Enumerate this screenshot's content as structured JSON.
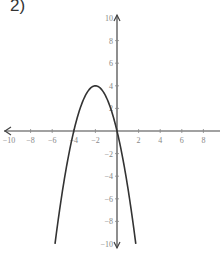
{
  "problem_label": "2)",
  "chart_data": {
    "type": "line",
    "title": "",
    "xlabel": "",
    "ylabel": "",
    "xlim": [
      -10,
      10
    ],
    "ylim": [
      -10,
      10
    ],
    "grid": false,
    "x_ticks": [
      -10,
      -8,
      -6,
      -4,
      -2,
      2,
      4,
      6,
      8,
      10
    ],
    "y_ticks": [
      -10,
      -8,
      -6,
      -4,
      -2,
      2,
      4,
      6,
      8,
      10
    ],
    "x_tick_labels": [
      "−10",
      "−8",
      "−6",
      "−4",
      "−2",
      "2",
      "4",
      "6",
      "8",
      "1"
    ],
    "y_tick_labels": [
      "−10",
      "−8",
      "−6",
      "−4",
      "−2",
      "2",
      "4",
      "6",
      "8",
      "10"
    ],
    "series": [
      {
        "name": "parabola",
        "equation": "y = -(x+2)^2 + 4",
        "vertex": [
          -2,
          4
        ],
        "x_intercepts": [
          -4,
          0
        ],
        "x": [
          -5.74,
          -5,
          -4,
          -3,
          -2,
          -1,
          0,
          1,
          1.74
        ],
        "y": [
          -10,
          -5,
          0,
          3,
          4,
          3,
          0,
          -5,
          -10
        ]
      }
    ],
    "colors": {
      "curve": "#333333",
      "axes": "#444444",
      "ticks": "#888888"
    }
  }
}
